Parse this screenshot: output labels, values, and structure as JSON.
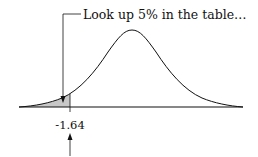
{
  "diagram": {
    "callout": {
      "text": "Look up 5% in the table…"
    },
    "critical_value": {
      "label": "-1.64"
    },
    "shaded_area": {
      "description": "left tail area",
      "fill": "#c8c8c8"
    },
    "colors": {
      "line": "#111111",
      "shade": "#c8c8c8"
    }
  }
}
